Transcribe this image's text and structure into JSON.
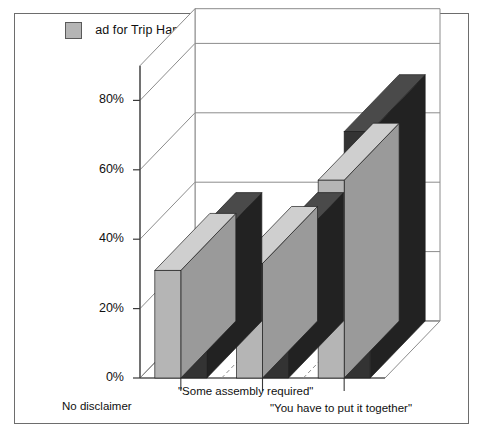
{
  "legend": {
    "items": [
      {
        "label": "ad for Trip Hammer toy",
        "color": "#b5b5b5",
        "icon": "legend-swatch-light"
      },
      {
        "label": "ad for Homestretch toy",
        "color": "#333333",
        "icon": "legend-swatch-dark"
      }
    ]
  },
  "axis": {
    "y_ticks": [
      "0%",
      "20%",
      "40%",
      "60%",
      "80%"
    ],
    "x_ticks": [
      "No disclaimer",
      "\"Some assembly required\"",
      "\"You have to put it together\""
    ]
  },
  "chart_data": {
    "type": "bar",
    "title": "",
    "subtitle": "",
    "xlabel": "",
    "ylabel": "",
    "ylim": [
      0,
      90
    ],
    "grid": true,
    "legend_position": "top",
    "three_d": true,
    "categories": [
      "No disclaimer",
      "\"Some assembly required\"",
      "\"You have to put it together\""
    ],
    "series": [
      {
        "name": "ad for Trip Hammer toy",
        "color": "#b5b5b5",
        "values": [
          31,
          33,
          57
        ]
      },
      {
        "name": "ad for Homestretch toy",
        "color": "#333333",
        "values": [
          37,
          37,
          71
        ]
      }
    ],
    "tick_labels_y": [
      "0%",
      "20%",
      "40%",
      "60%",
      "80%"
    ],
    "tick_values_y": [
      0,
      20,
      40,
      60,
      80
    ]
  },
  "colors": {
    "bar_light_front": "#b5b5b5",
    "bar_light_top": "#cfcfcf",
    "bar_light_side": "#9a9a9a",
    "bar_dark_front": "#333333",
    "bar_dark_top": "#4a4a4a",
    "bar_dark_side": "#222222",
    "frame": "#6d6d6d",
    "grid": "#8c8c8c"
  }
}
